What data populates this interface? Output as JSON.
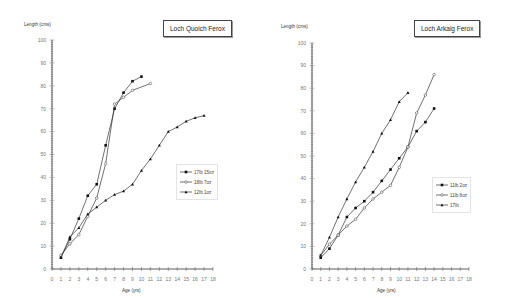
{
  "chart_data": [
    {
      "type": "line",
      "title": "Loch Quoich Ferox",
      "xlabel": "Age (yrs)",
      "ylabel": "Length (cms)",
      "xlim": [
        0,
        18
      ],
      "ylim": [
        0,
        100
      ],
      "x_ticks": [
        0,
        1,
        2,
        3,
        4,
        5,
        6,
        7,
        8,
        9,
        10,
        11,
        12,
        13,
        14,
        15,
        16,
        17,
        18
      ],
      "y_ticks": [
        0,
        10,
        20,
        30,
        40,
        50,
        60,
        70,
        80,
        90,
        100
      ],
      "grid": false,
      "legend_position": "right-middle",
      "series": [
        {
          "name": "17lb 15oz",
          "marker": "filled-square",
          "x": [
            1,
            2,
            3,
            4,
            5,
            6,
            7,
            8,
            9,
            10
          ],
          "values": [
            5,
            13,
            22,
            32,
            37,
            54,
            70,
            77,
            82,
            84
          ]
        },
        {
          "name": "18lb 7oz",
          "marker": "open-circle",
          "x": [
            1,
            2,
            3,
            4,
            5,
            6,
            7,
            8,
            9,
            11
          ],
          "values": [
            6,
            11,
            15,
            23,
            31,
            46,
            72,
            75,
            78,
            81
          ]
        },
        {
          "name": "12lb 1oz",
          "marker": "filled-triangle",
          "x": [
            1,
            2,
            3,
            4,
            5,
            6,
            7,
            8,
            9,
            10,
            11,
            12,
            13,
            14,
            15,
            16,
            17
          ],
          "values": [
            5,
            14,
            18,
            24,
            27,
            30,
            32.5,
            34,
            37,
            43,
            48,
            54,
            60,
            62,
            64.5,
            66,
            67
          ]
        }
      ]
    },
    {
      "type": "line",
      "title": "Loch Arkaig Ferox",
      "xlabel": "Age (yrs)",
      "ylabel": "Length (cms)",
      "xlim": [
        0,
        18
      ],
      "ylim": [
        0,
        100
      ],
      "x_ticks": [
        0,
        1,
        2,
        3,
        4,
        5,
        6,
        7,
        8,
        9,
        10,
        11,
        12,
        13,
        14,
        15,
        16,
        17,
        18
      ],
      "y_ticks": [
        0,
        10,
        20,
        30,
        40,
        50,
        60,
        70,
        80,
        90,
        100
      ],
      "grid": false,
      "legend_position": "right-middle",
      "series": [
        {
          "name": "11lb 2oz",
          "marker": "filled-square",
          "x": [
            1,
            2,
            3,
            4,
            5,
            6,
            7,
            8,
            9,
            10,
            11,
            12,
            13,
            14
          ],
          "values": [
            5,
            9,
            15,
            23,
            27,
            30,
            34,
            39,
            44,
            49,
            54,
            61,
            65,
            71
          ]
        },
        {
          "name": "11lb 8oz",
          "marker": "open-circle",
          "x": [
            1,
            2,
            3,
            4,
            5,
            6,
            7,
            8,
            9,
            10,
            11,
            12,
            13,
            14
          ],
          "values": [
            6,
            11,
            15,
            19,
            22,
            27,
            31,
            34,
            37,
            45,
            54,
            69,
            77,
            86
          ]
        },
        {
          "name": "17lb",
          "marker": "filled-triangle",
          "x": [
            1,
            2,
            3,
            4,
            5,
            6,
            7,
            8,
            9,
            10,
            11
          ],
          "values": [
            6,
            14,
            23,
            31,
            38.5,
            45,
            52,
            60,
            66,
            74,
            78
          ]
        }
      ]
    }
  ]
}
